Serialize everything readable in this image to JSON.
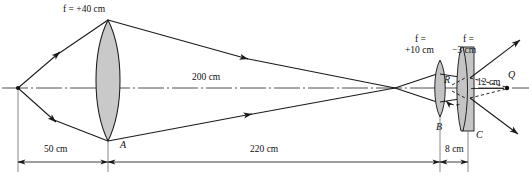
{
  "figure": {
    "background_color": "#ffffff",
    "ink_color": "#1a1a1a",
    "lens_fill_color": "#c9c9c9"
  },
  "labels": {
    "lens1_focal": "f = +40 cm",
    "lens2_focal_line1": "f =",
    "lens2_focal_line2": "+10 cm",
    "lens3_focal_line1": "f =",
    "lens3_focal_line2": "−3 cm",
    "axis_distance_200": "200 cm",
    "distance_50": "50 cm",
    "distance_220": "220 cm",
    "distance_8": "8 cm",
    "distance_12": "12 cm",
    "point_A": "A",
    "point_B": "B",
    "point_C": "C",
    "point_R": "R",
    "point_Q": "Q"
  },
  "optics_data": {
    "type": "ray-diagram",
    "elements": [
      {
        "name": "object-point",
        "kind": "point",
        "label": "",
        "x_px": 18,
        "y_px": 88
      },
      {
        "name": "lens-1",
        "kind": "converging-lens",
        "focal_length_cm": 40,
        "label": "f = +40 cm",
        "vertex_label": "A",
        "x_px": 108
      },
      {
        "name": "lens-2",
        "kind": "converging-lens",
        "focal_length_cm": 10,
        "label": "f = +10 cm",
        "vertex_label": "B",
        "x_px": 440
      },
      {
        "name": "lens-3",
        "kind": "diverging-lens",
        "focal_length_cm": -3,
        "label": "f = −3 cm",
        "vertex_label": "C",
        "x_px": 468
      },
      {
        "name": "image-point-Q",
        "kind": "point",
        "label": "Q",
        "x_px": 508,
        "y_px": 88
      }
    ],
    "distances": [
      {
        "name": "object-to-lens1",
        "value": 50,
        "unit": "cm",
        "label": "50 cm"
      },
      {
        "name": "lens1-to-lens2",
        "value": 220,
        "unit": "cm",
        "label": "220 cm"
      },
      {
        "name": "lens2-to-lens3",
        "value": 8,
        "unit": "cm",
        "label": "8 cm"
      },
      {
        "name": "lens3-to-Q",
        "value": 12,
        "unit": "cm",
        "label": "12 cm"
      },
      {
        "name": "axis-intermediate",
        "value": 200,
        "unit": "cm",
        "label": "200 cm"
      }
    ]
  }
}
